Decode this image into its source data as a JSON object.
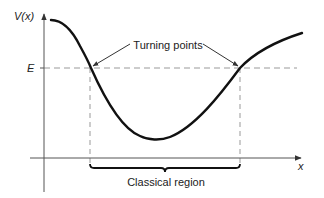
{
  "diagram": {
    "type": "potential-energy-curve",
    "axes": {
      "y_label": "V(x)",
      "x_label": "x"
    },
    "energy_label": "E",
    "annotations": {
      "turning_points": "Turning points",
      "classical_region": "Classical region"
    },
    "colors": {
      "curve": "#111111",
      "axes": "#555555",
      "dashed": "#888888",
      "text": "#222222"
    }
  }
}
